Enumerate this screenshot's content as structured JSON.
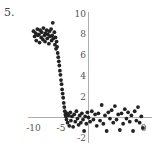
{
  "figure_label": "5.",
  "chart_data": {
    "type": "scatter",
    "title": "",
    "xlabel": "",
    "ylabel": "",
    "xlim": [
      -11,
      11
    ],
    "ylim": [
      -2.5,
      10
    ],
    "grid": false,
    "legend": null,
    "x_ticks": [
      -10,
      -5,
      10
    ],
    "x_tick_labels": [
      "-10",
      "-5",
      "0"
    ],
    "y_ticks": [
      10,
      8,
      6,
      4,
      2,
      -2
    ],
    "y_tick_labels": [
      "10",
      "8",
      "6",
      "4",
      "2",
      "-2"
    ],
    "point_color": "#222222",
    "series": [
      {
        "name": "data",
        "points": [
          [
            -10,
            8.3
          ],
          [
            -9.8,
            7.8
          ],
          [
            -9.6,
            8.1
          ],
          [
            -9.5,
            7.4
          ],
          [
            -9.3,
            8.5
          ],
          [
            -9.2,
            7.9
          ],
          [
            -9,
            8.0
          ],
          [
            -8.9,
            7.2
          ],
          [
            -8.8,
            8.4
          ],
          [
            -8.6,
            7.7
          ],
          [
            -8.5,
            8.2
          ],
          [
            -8.3,
            7.5
          ],
          [
            -8.2,
            8.6
          ],
          [
            -8,
            7.9
          ],
          [
            -7.9,
            7.3
          ],
          [
            -7.8,
            8.1
          ],
          [
            -7.6,
            8.4
          ],
          [
            -7.5,
            7.6
          ],
          [
            -7.4,
            8.0
          ],
          [
            -7.2,
            7.1
          ],
          [
            -7.1,
            8.3
          ],
          [
            -7,
            7.8
          ],
          [
            -6.8,
            8.5
          ],
          [
            -6.7,
            7.4
          ],
          [
            -6.6,
            7.9
          ],
          [
            -6.5,
            9.1
          ],
          [
            -6.4,
            7.6
          ],
          [
            -6.2,
            8.2
          ],
          [
            -6.1,
            7.0
          ],
          [
            -6,
            7.7
          ],
          [
            -5.9,
            6.6
          ],
          [
            -5.8,
            7.3
          ],
          [
            -5.7,
            6.8
          ],
          [
            -5.6,
            6.2
          ],
          [
            -5.5,
            5.8
          ],
          [
            -5.4,
            5.4
          ],
          [
            -5.3,
            5.0
          ],
          [
            -5.2,
            4.5
          ],
          [
            -5.1,
            4.1
          ],
          [
            -5,
            3.6
          ],
          [
            -4.9,
            3.2
          ],
          [
            -4.8,
            2.7
          ],
          [
            -4.7,
            2.3
          ],
          [
            -4.6,
            1.9
          ],
          [
            -4.5,
            1.4
          ],
          [
            -4.4,
            1.0
          ],
          [
            -4.3,
            0.6
          ],
          [
            -4.2,
            0.3
          ],
          [
            -4.1,
            0.1
          ],
          [
            -4,
            -0.2
          ],
          [
            -3.9,
            0.4
          ],
          [
            -3.8,
            -0.5
          ],
          [
            -3.6,
            0.2
          ],
          [
            -3.5,
            -0.8
          ],
          [
            -3.3,
            0.5
          ],
          [
            -3.2,
            -0.3
          ],
          [
            -3,
            0.1
          ],
          [
            -2.8,
            -0.9
          ],
          [
            -2.6,
            0.3
          ],
          [
            -2.4,
            -0.4
          ],
          [
            -2.2,
            0.6
          ],
          [
            -2,
            -0.1
          ],
          [
            -1.8,
            -0.7
          ],
          [
            -1.6,
            0.2
          ],
          [
            -1.4,
            -0.5
          ],
          [
            -1.2,
            0.4
          ],
          [
            -1,
            -0.2
          ],
          [
            -0.8,
            -1.3
          ],
          [
            -0.6,
            0.1
          ],
          [
            -0.4,
            -0.6
          ],
          [
            -0.2,
            0.5
          ],
          [
            0,
            0.0
          ],
          [
            0.3,
            -0.4
          ],
          [
            0.6,
            0.6
          ],
          [
            0.9,
            -0.2
          ],
          [
            1.2,
            0.3
          ],
          [
            1.5,
            -0.8
          ],
          [
            1.8,
            0.4
          ],
          [
            2.1,
            -0.3
          ],
          [
            2.4,
            1.2
          ],
          [
            2.7,
            -0.6
          ],
          [
            3,
            0.2
          ],
          [
            3.3,
            -1.3
          ],
          [
            3.6,
            0.5
          ],
          [
            3.9,
            -0.1
          ],
          [
            4.2,
            0.7
          ],
          [
            4.5,
            -0.5
          ],
          [
            4.8,
            1.1
          ],
          [
            5.1,
            -0.2
          ],
          [
            5.4,
            0.3
          ],
          [
            5.7,
            -1.2
          ],
          [
            6,
            0.4
          ],
          [
            6.3,
            -0.6
          ],
          [
            6.6,
            0.8
          ],
          [
            6.9,
            -0.1
          ],
          [
            7.2,
            0.5
          ],
          [
            7.5,
            -0.4
          ],
          [
            7.8,
            0.2
          ],
          [
            8.1,
            -1.3
          ],
          [
            8.4,
            0.6
          ],
          [
            8.7,
            -0.3
          ],
          [
            9,
            1.0
          ],
          [
            9.3,
            -0.5
          ],
          [
            9.6,
            0.1
          ],
          [
            9.9,
            -1.0
          ]
        ]
      }
    ]
  }
}
